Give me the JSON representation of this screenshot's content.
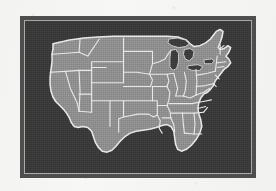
{
  "image": {
    "kind": "scanned-halftone-map",
    "subject": "Contiguous United States outline map with state boundaries",
    "alt_text": "Black and white halftone scan of a map of the continental United States showing state borders, framed by a dark rectangular border on white paper."
  },
  "frame": {
    "border_color": "#4e4e4e",
    "inner_rule_color": "#cfcfcf",
    "field_color": "#3a3a3a"
  },
  "palette": {
    "paper": "#f7f7f6",
    "land_fill": "#8f8f8f",
    "boundary_line": "#e8e8e8",
    "water_dark": "#3d3d3d"
  },
  "map_data": {
    "type": "choropleth-outline",
    "projection": "albers-usa-approx",
    "region": "United States (lower 48)",
    "title": "",
    "legend": [],
    "labels": [],
    "features": [
      {
        "name": "Washington",
        "abbr": "WA"
      },
      {
        "name": "Oregon",
        "abbr": "OR"
      },
      {
        "name": "California",
        "abbr": "CA"
      },
      {
        "name": "Nevada",
        "abbr": "NV"
      },
      {
        "name": "Idaho",
        "abbr": "ID"
      },
      {
        "name": "Montana",
        "abbr": "MT"
      },
      {
        "name": "Wyoming",
        "abbr": "WY"
      },
      {
        "name": "Utah",
        "abbr": "UT"
      },
      {
        "name": "Arizona",
        "abbr": "AZ"
      },
      {
        "name": "Colorado",
        "abbr": "CO"
      },
      {
        "name": "New Mexico",
        "abbr": "NM"
      },
      {
        "name": "North Dakota",
        "abbr": "ND"
      },
      {
        "name": "South Dakota",
        "abbr": "SD"
      },
      {
        "name": "Nebraska",
        "abbr": "NE"
      },
      {
        "name": "Kansas",
        "abbr": "KS"
      },
      {
        "name": "Oklahoma",
        "abbr": "OK"
      },
      {
        "name": "Texas",
        "abbr": "TX"
      },
      {
        "name": "Minnesota",
        "abbr": "MN"
      },
      {
        "name": "Iowa",
        "abbr": "IA"
      },
      {
        "name": "Missouri",
        "abbr": "MO"
      },
      {
        "name": "Arkansas",
        "abbr": "AR"
      },
      {
        "name": "Louisiana",
        "abbr": "LA"
      },
      {
        "name": "Wisconsin",
        "abbr": "WI"
      },
      {
        "name": "Illinois",
        "abbr": "IL"
      },
      {
        "name": "Michigan",
        "abbr": "MI"
      },
      {
        "name": "Indiana",
        "abbr": "IN"
      },
      {
        "name": "Ohio",
        "abbr": "OH"
      },
      {
        "name": "Kentucky",
        "abbr": "KY"
      },
      {
        "name": "Tennessee",
        "abbr": "TN"
      },
      {
        "name": "Mississippi",
        "abbr": "MS"
      },
      {
        "name": "Alabama",
        "abbr": "AL"
      },
      {
        "name": "Georgia",
        "abbr": "GA"
      },
      {
        "name": "Florida",
        "abbr": "FL"
      },
      {
        "name": "South Carolina",
        "abbr": "SC"
      },
      {
        "name": "North Carolina",
        "abbr": "NC"
      },
      {
        "name": "Virginia",
        "abbr": "VA"
      },
      {
        "name": "West Virginia",
        "abbr": "WV"
      },
      {
        "name": "Maryland",
        "abbr": "MD"
      },
      {
        "name": "Delaware",
        "abbr": "DE"
      },
      {
        "name": "Pennsylvania",
        "abbr": "PA"
      },
      {
        "name": "New Jersey",
        "abbr": "NJ"
      },
      {
        "name": "New York",
        "abbr": "NY"
      },
      {
        "name": "Connecticut",
        "abbr": "CT"
      },
      {
        "name": "Rhode Island",
        "abbr": "RI"
      },
      {
        "name": "Massachusetts",
        "abbr": "MA"
      },
      {
        "name": "Vermont",
        "abbr": "VT"
      },
      {
        "name": "New Hampshire",
        "abbr": "NH"
      },
      {
        "name": "Maine",
        "abbr": "ME"
      }
    ],
    "water_features": [
      {
        "name": "Lake Superior"
      },
      {
        "name": "Lake Michigan"
      },
      {
        "name": "Lake Huron"
      },
      {
        "name": "Lake Erie"
      },
      {
        "name": "Lake Ontario"
      }
    ]
  }
}
